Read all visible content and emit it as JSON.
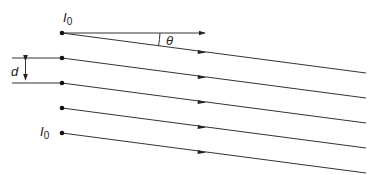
{
  "diagram": {
    "labels": {
      "top_source": "I",
      "top_source_sub": "0",
      "bottom_source": "I",
      "bottom_source_sub": "0",
      "angle": "θ",
      "spacing": "d"
    },
    "sources": [
      {
        "x": 62,
        "y": 33
      },
      {
        "x": 62,
        "y": 58
      },
      {
        "x": 62,
        "y": 83
      },
      {
        "x": 62,
        "y": 108
      },
      {
        "x": 62,
        "y": 133
      }
    ],
    "ray_end_x": 366,
    "ray_drop": 40,
    "colors": {
      "line": "#333333",
      "dot": "#111111",
      "background": "#ffffff"
    }
  }
}
